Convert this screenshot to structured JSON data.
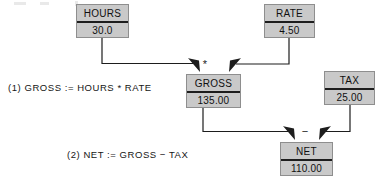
{
  "diagram": {
    "colors": {
      "box_fill": "#c9c9c9",
      "box_border": "#8e8e8e",
      "divider": "#1d1d1d",
      "wire": "#1d1d1d",
      "text": "#101010",
      "background": "#ffffff"
    },
    "nodes": [
      {
        "id": "hours",
        "name": "HOURS",
        "value": "30.0"
      },
      {
        "id": "rate",
        "name": "RATE",
        "value": "4.50"
      },
      {
        "id": "gross",
        "name": "GROSS",
        "value": "135.00"
      },
      {
        "id": "tax",
        "name": "TAX",
        "value": "25.00"
      },
      {
        "id": "net",
        "name": "NET",
        "value": "110.00"
      }
    ],
    "operators": [
      {
        "id": "mul",
        "symbol": "*",
        "meaning": "multiply",
        "target": "gross"
      },
      {
        "id": "minus",
        "symbol": "−",
        "meaning": "subtract",
        "target": "net"
      }
    ],
    "edges": [
      {
        "from": "hours",
        "to": "gross"
      },
      {
        "from": "rate",
        "to": "gross"
      },
      {
        "from": "gross",
        "to": "net"
      },
      {
        "from": "tax",
        "to": "net"
      }
    ],
    "captions": [
      {
        "id": "eq1",
        "text": "(1) GROSS := HOURS * RATE"
      },
      {
        "id": "eq2",
        "text": "(2) NET := GROSS − TAX"
      }
    ]
  }
}
